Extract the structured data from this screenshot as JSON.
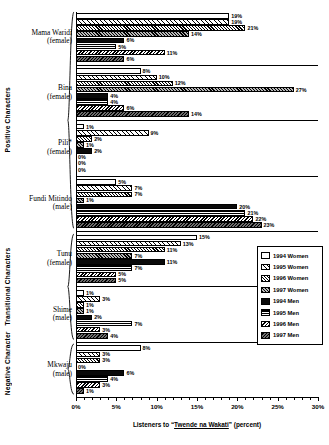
{
  "chart_data": {
    "type": "bar",
    "orientation": "horizontal",
    "title": "",
    "xlabel": "Listeners to \"Twende na Wakati\" (percent)",
    "xlabel_parts": {
      "prefix": "Listeners to “",
      "underlined": "Twende na Wakati",
      "suffix": "” (percent)"
    },
    "ylabel": "",
    "xlim": [
      0,
      30
    ],
    "xticks": [
      0,
      5,
      10,
      15,
      20,
      25,
      30
    ],
    "xtick_labels": [
      "0%",
      "5%",
      "10%",
      "15%",
      "20%",
      "25%",
      "30%"
    ],
    "grid": false,
    "legend_position": "right-middle",
    "series": [
      {
        "name": "1994 Women",
        "pattern": "open-white",
        "values": [
          19,
          8,
          1,
          5,
          15,
          1,
          8
        ]
      },
      {
        "name": "1995 Women",
        "pattern": "wide-diagonal-hatch",
        "values": [
          19,
          10,
          9,
          7,
          13,
          3,
          3
        ]
      },
      {
        "name": "1996 Women",
        "pattern": "dense-diagonal-hatch",
        "values": [
          21,
          12,
          2,
          7,
          11,
          1,
          3
        ]
      },
      {
        "name": "1997 Women",
        "pattern": "gray-diagonal-hatch",
        "values": [
          14,
          27,
          1,
          1,
          7,
          1,
          0
        ]
      },
      {
        "name": "1994 Men",
        "pattern": "solid-black",
        "values": [
          6,
          4,
          2,
          20,
          11,
          2,
          6
        ]
      },
      {
        "name": "1995 Men",
        "pattern": "black-horizontal-line",
        "values": [
          5,
          4,
          0,
          21,
          7,
          7,
          4
        ]
      },
      {
        "name": "1996 Men",
        "pattern": "back-diagonal-hatch",
        "values": [
          11,
          6,
          0,
          22,
          5,
          3,
          3
        ]
      },
      {
        "name": "1997 Men",
        "pattern": "dark-gray-hatch",
        "values": [
          6,
          14,
          0,
          23,
          5,
          4,
          1
        ]
      }
    ],
    "categories": [
      {
        "name": "Mama Waridi",
        "sub": "(female)",
        "section": "Positive Characters"
      },
      {
        "name": "Bina",
        "sub": "(female)",
        "section": "Positive Characters"
      },
      {
        "name": "Pili*",
        "sub": "(female)",
        "section": "Positive Characters"
      },
      {
        "name": "Fundi Mitindo",
        "sub": "(male)",
        "section": "Positive Characters"
      },
      {
        "name": "Tunu",
        "sub": "(female)",
        "section": "Transitional Characters"
      },
      {
        "name": "Shime",
        "sub": "(male)",
        "section": "Transitional Characters"
      },
      {
        "name": "Mkwaju",
        "sub": "(male)",
        "section": "Negative Character"
      }
    ],
    "sections": [
      {
        "label": "Positive Characters",
        "categories": [
          "Mama Waridi",
          "Bina",
          "Pili*",
          "Fundi Mitindo"
        ]
      },
      {
        "label": "Transitional Characters",
        "categories": [
          "Tunu",
          "Shime"
        ]
      },
      {
        "label": "Negative Character",
        "categories": [
          "Mkwaju"
        ]
      }
    ],
    "value_labels_suffix": "%"
  },
  "legend": {
    "items": [
      {
        "label": "1994 Women",
        "swatch": "p-w94"
      },
      {
        "label": "1995 Women",
        "swatch": "p-w95"
      },
      {
        "label": "1996 Women",
        "swatch": "p-w96"
      },
      {
        "label": "1997 Women",
        "swatch": "p-w97"
      },
      {
        "label": "1994 Men",
        "swatch": "p-m94"
      },
      {
        "label": "1995 Men",
        "swatch": "p-m95"
      },
      {
        "label": "1996 Men",
        "swatch": "p-m96"
      },
      {
        "label": "1997 Men",
        "swatch": "p-m97"
      }
    ]
  },
  "colors": {
    "axis": "#000000",
    "background": "#ffffff",
    "bar_outline": "#000000"
  }
}
